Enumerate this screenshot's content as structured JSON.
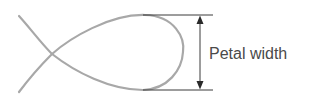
{
  "diagram": {
    "subject": "petal",
    "measurement": "width",
    "label": "Petal width",
    "colors": {
      "outline": "#a8a8a8",
      "dimension": "#3a3a3a",
      "label": "#4a4a4a"
    }
  }
}
